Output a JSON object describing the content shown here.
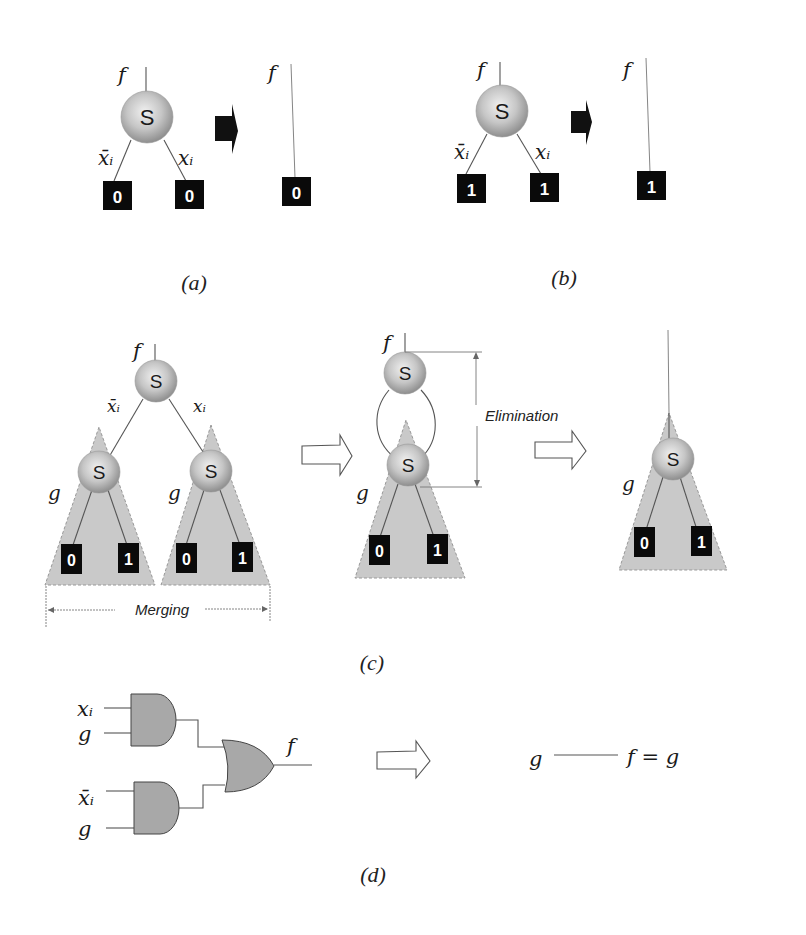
{
  "panels": {
    "a": {
      "caption": "(a)",
      "root_label": "f",
      "node_label": "S",
      "left_edge_label": "x̄ᵢ",
      "right_edge_label": "xᵢ",
      "left_leaf": "0",
      "right_leaf": "0",
      "result_label": "f",
      "result_leaf": "0"
    },
    "b": {
      "caption": "(b)",
      "root_label": "f",
      "node_label": "S",
      "left_edge_label": "x̄ᵢ",
      "right_edge_label": "xᵢ",
      "left_leaf": "1",
      "right_leaf": "1",
      "result_label": "f",
      "result_leaf": "1"
    },
    "c": {
      "caption": "(c)",
      "root_label": "f",
      "root_node": "S",
      "left_edge_label": "x̄ᵢ",
      "right_edge_label": "xᵢ",
      "subtree_label": "g",
      "subtree_node": "S",
      "subtree_leaves": [
        "0",
        "1"
      ],
      "merging_label": "Merging",
      "elimination_label": "Elimination",
      "mid_root_label": "f",
      "mid_subtree_label": "g",
      "final_subtree_label": "g"
    },
    "d": {
      "caption": "(d)",
      "gate1_inputs": [
        "xᵢ",
        "g"
      ],
      "gate2_inputs": [
        "x̄ᵢ",
        "g"
      ],
      "output_label": "f",
      "result_input": "g",
      "result_expression": "f = g"
    }
  },
  "colors": {
    "node_fill": "#c8c8c8",
    "leaf_fill": "#0a0a0a",
    "subtree_fill": "#c9c9c9",
    "gate_fill": "#a8a8a8"
  }
}
